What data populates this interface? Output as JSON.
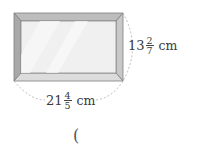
{
  "figure": {
    "colors": {
      "frame": "#a9a9a9",
      "frame_light": "#d2d2d2",
      "frame_dark": "#7e7e7e",
      "glass": "#efefef",
      "dash": "#9a9a9a"
    }
  },
  "labels": {
    "height": {
      "whole": "13",
      "numerator": "2",
      "denominator": "7",
      "unit": "cm"
    },
    "width": {
      "whole": "21",
      "numerator": "4",
      "denominator": "5",
      "unit": "cm"
    }
  },
  "answer": {
    "open_paren": "("
  }
}
